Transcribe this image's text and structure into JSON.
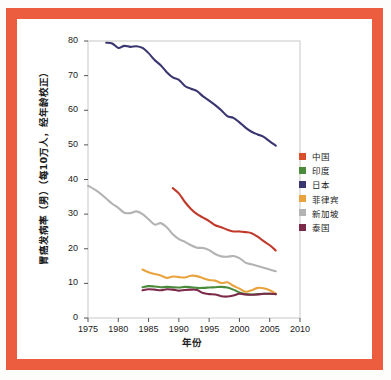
{
  "figure": {
    "frame_color": "#ec5c3f",
    "background_color": "#ffffff"
  },
  "chart_data": {
    "type": "line",
    "title": "",
    "xlabel": "年份",
    "ylabel": "胃癌发病率（男）（每10万人，经年龄校正）",
    "xlim": [
      1975,
      2010
    ],
    "ylim": [
      0,
      80
    ],
    "xticks": [
      1975,
      1980,
      1985,
      1990,
      1995,
      2000,
      2005,
      2010
    ],
    "yticks": [
      0,
      10,
      20,
      30,
      40,
      50,
      60,
      70,
      80
    ],
    "grid": false,
    "legend_position": "right",
    "series": [
      {
        "name": "中国",
        "color": "#c0392b",
        "x": [
          1989,
          1990,
          1991,
          1992,
          1993,
          1994,
          1995,
          1996,
          1997,
          1998,
          1999,
          2000,
          2001,
          2002,
          2003,
          2004,
          2005,
          2006
        ],
        "values": [
          37.5,
          36.0,
          33.5,
          31.5,
          30.0,
          29.0,
          28.0,
          26.8,
          26.2,
          25.5,
          25.0,
          25.0,
          24.8,
          24.5,
          23.5,
          22.2,
          21.0,
          19.5
        ]
      },
      {
        "name": "印度",
        "color": "#4a8b3c",
        "x": [
          1984,
          1985,
          1986,
          1987,
          1988,
          1989,
          1990,
          1991,
          1992,
          1993,
          1994,
          1995,
          1996,
          1997,
          1998,
          1999,
          2000,
          2001,
          2002,
          2003,
          2004,
          2005,
          2006
        ],
        "values": [
          8.9,
          9.2,
          9.1,
          8.9,
          9.0,
          8.9,
          8.8,
          9.0,
          8.9,
          8.7,
          8.7,
          8.8,
          8.9,
          9.0,
          8.8,
          8.2,
          7.4,
          6.9,
          6.8,
          6.9,
          7.0,
          7.0,
          6.9
        ]
      },
      {
        "name": "日本",
        "color": "#3a3670",
        "x": [
          1978,
          1979,
          1980,
          1981,
          1982,
          1983,
          1984,
          1985,
          1986,
          1987,
          1988,
          1989,
          1990,
          1991,
          1992,
          1993,
          1994,
          1995,
          1996,
          1997,
          1998,
          1999,
          2000,
          2001,
          2002,
          2003,
          2004,
          2005,
          2006
        ],
        "values": [
          79.5,
          79.3,
          78.0,
          78.6,
          78.3,
          78.5,
          78.0,
          76.5,
          74.5,
          73.0,
          71.0,
          69.5,
          68.8,
          67.0,
          66.2,
          65.5,
          64.0,
          62.8,
          61.5,
          60.0,
          58.3,
          57.8,
          56.5,
          55.0,
          53.8,
          53.0,
          52.3,
          51.0,
          49.8
        ]
      },
      {
        "name": "菲律宾",
        "color": "#e8a33d",
        "x": [
          1984,
          1985,
          1986,
          1987,
          1988,
          1989,
          1990,
          1991,
          1992,
          1993,
          1994,
          1995,
          1996,
          1997,
          1998,
          1999,
          2000,
          2001,
          2002,
          2003,
          2004,
          2005,
          2006
        ],
        "values": [
          14.0,
          13.2,
          12.7,
          12.3,
          11.6,
          12.0,
          11.8,
          11.7,
          12.2,
          12.1,
          11.5,
          11.0,
          10.8,
          10.1,
          10.3,
          9.3,
          8.5,
          7.6,
          8.0,
          8.7,
          8.6,
          8.0,
          7.0
        ]
      },
      {
        "name": "新加坡",
        "color": "#b3b3b3",
        "x": [
          1975,
          1976,
          1977,
          1978,
          1979,
          1980,
          1981,
          1982,
          1983,
          1984,
          1985,
          1986,
          1987,
          1988,
          1989,
          1990,
          1991,
          1992,
          1993,
          1994,
          1995,
          1996,
          1997,
          1998,
          1999,
          2000,
          2001,
          2002,
          2003,
          2004,
          2005,
          2006
        ],
        "values": [
          38.2,
          37.2,
          36.0,
          34.5,
          33.0,
          31.8,
          30.4,
          30.3,
          30.8,
          30.0,
          28.5,
          27.0,
          27.4,
          26.2,
          24.2,
          22.8,
          22.0,
          21.0,
          20.3,
          20.2,
          19.6,
          18.5,
          17.8,
          17.7,
          17.9,
          17.3,
          16.0,
          15.5,
          15.0,
          14.5,
          14.0,
          13.5
        ]
      },
      {
        "name": "泰国",
        "color": "#7b2a4a",
        "x": [
          1984,
          1985,
          1986,
          1987,
          1988,
          1989,
          1990,
          1991,
          1992,
          1993,
          1994,
          1995,
          1996,
          1997,
          1998,
          1999,
          2000,
          2001,
          2002,
          2003,
          2004,
          2005,
          2006
        ],
        "values": [
          8.0,
          8.3,
          8.2,
          8.0,
          8.3,
          8.2,
          7.9,
          8.1,
          8.2,
          8.1,
          7.2,
          6.9,
          6.8,
          6.3,
          6.2,
          6.5,
          7.0,
          6.8,
          6.7,
          6.8,
          7.0,
          7.0,
          6.9
        ]
      }
    ]
  },
  "axis": {
    "ytick_labels": [
      "80",
      "70",
      "60",
      "50",
      "40",
      "30",
      "20",
      "10",
      "0"
    ],
    "xtick_labels": [
      "1975",
      "1980",
      "1985",
      "1990",
      "1995",
      "2000",
      "2005",
      "2010"
    ]
  },
  "legend": {
    "items": [
      {
        "label": "中国",
        "color": "#d94f2b"
      },
      {
        "label": "印度",
        "color": "#4a8b3c"
      },
      {
        "label": "日本",
        "color": "#3a3670"
      },
      {
        "label": "菲律宾",
        "color": "#e8a33d"
      },
      {
        "label": "新加坡",
        "color": "#b3b3b3"
      },
      {
        "label": "泰国",
        "color": "#7b2a4a"
      }
    ]
  }
}
